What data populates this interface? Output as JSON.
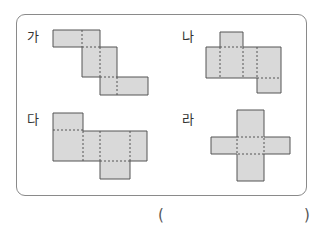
{
  "problem": {
    "options": [
      {
        "id": "ga",
        "label": "가",
        "type": "net"
      },
      {
        "id": "na",
        "label": "나",
        "type": "net"
      },
      {
        "id": "da",
        "label": "다",
        "type": "net"
      },
      {
        "id": "ra",
        "label": "라",
        "type": "net"
      }
    ],
    "answer_open": "(",
    "answer_close": ")",
    "answer_value": ""
  },
  "colors": {
    "face_fill": "#d9d9d9",
    "face_stroke": "#555555",
    "fold_line": "#555555",
    "frame": "#8a8a8a"
  }
}
